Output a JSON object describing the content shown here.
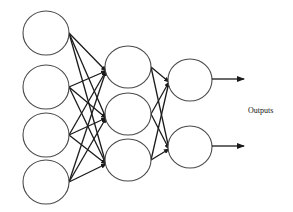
{
  "diagram": {
    "type": "neural-network",
    "layers": [
      {
        "name": "input",
        "node_count": 4
      },
      {
        "name": "hidden",
        "node_count": 3
      },
      {
        "name": "output",
        "node_count": 2
      }
    ],
    "connectivity": "fully-connected",
    "output_label": "Outputs",
    "colors": {
      "node_stroke": "#4a4a4a",
      "edge": "#1a1a1a",
      "background": "#ffffff"
    }
  }
}
